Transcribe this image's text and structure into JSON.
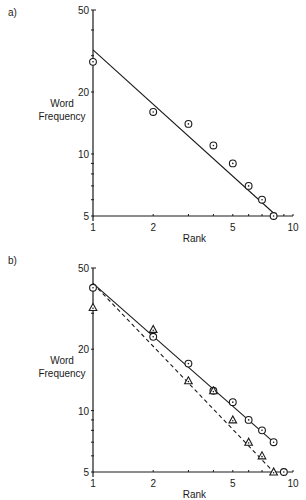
{
  "chart_data": [
    {
      "panel": "a)",
      "type": "scatter",
      "xlabel": "Rank",
      "ylabel": "Word Frequency",
      "xscale": "log",
      "yscale": "log",
      "xlim": [
        1,
        10
      ],
      "ylim": [
        5,
        50
      ],
      "xticks": [
        "1",
        "2",
        "5",
        "10"
      ],
      "yticks": [
        "5",
        "10",
        "20",
        "50"
      ],
      "series": [
        {
          "name": "observed",
          "marker": "circle-dot",
          "x": [
            1,
            2,
            3,
            4,
            5,
            6,
            7,
            8
          ],
          "y": [
            28,
            16,
            14,
            11,
            9,
            7,
            6,
            5
          ]
        },
        {
          "name": "fit",
          "style": "solid-line",
          "x": [
            1,
            8.3
          ],
          "y": [
            32,
            5
          ]
        }
      ]
    },
    {
      "panel": "b)",
      "type": "scatter",
      "xlabel": "Rank",
      "ylabel": "Word Frequency",
      "xscale": "log",
      "yscale": "log",
      "xlim": [
        1,
        10
      ],
      "ylim": [
        5,
        50
      ],
      "xticks": [
        "1",
        "2",
        "5",
        "10"
      ],
      "yticks": [
        "5",
        "10",
        "20",
        "50"
      ],
      "series": [
        {
          "name": "circles",
          "marker": "circle-dot",
          "x": [
            1,
            2,
            3,
            4,
            5,
            6,
            7,
            8,
            9
          ],
          "y": [
            40,
            23,
            17,
            12.5,
            11,
            9,
            8,
            7,
            5
          ]
        },
        {
          "name": "triangles",
          "marker": "triangle-dot",
          "x": [
            1,
            2,
            3,
            4,
            5,
            6,
            7,
            8
          ],
          "y": [
            32,
            25,
            14,
            12.5,
            9,
            7,
            6,
            5
          ]
        },
        {
          "name": "fit-circles",
          "style": "solid-line",
          "x": [
            1,
            8
          ],
          "y": [
            42,
            7
          ]
        },
        {
          "name": "fit-triangles",
          "style": "dashed-line",
          "x": [
            1,
            8
          ],
          "y": [
            42,
            5
          ]
        }
      ]
    }
  ]
}
